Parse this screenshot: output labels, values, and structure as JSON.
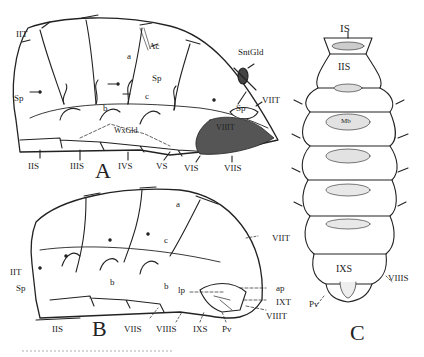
{
  "figure": {
    "panels": [
      {
        "id": "A",
        "letter": "A",
        "labels": {
          "IIT": "IIT",
          "Sp_left": "Sp",
          "a": "a",
          "Ac": "Ac",
          "Sp_mid": "Sp",
          "c": "c",
          "b": "b",
          "SntGld": "SntGld",
          "VIIT": "VIIT",
          "Sp_right": "Sp",
          "VIIIT": "VIIIT",
          "WxGld": "WxGld",
          "IIS": "IIS",
          "IIIS": "IIIS",
          "IVS": "IVS",
          "VS": "VS",
          "VIS": "VIS",
          "VIIS": "VIIS"
        }
      },
      {
        "id": "B",
        "letter": "B",
        "labels": {
          "IIT": "IIT",
          "Sp": "Sp",
          "a": "a",
          "c": "c",
          "b_left": "b",
          "b_right": "b",
          "VIIT": "VIIT",
          "lp": "lp",
          "ap": "ap",
          "IXT": "IXT",
          "VIIIT": "VIIIT",
          "IIS": "IIS",
          "VIIS": "VIIS",
          "VIIIS": "VIIIS",
          "IXS": "IXS",
          "Pv": "Pv"
        }
      },
      {
        "id": "C",
        "letter": "C",
        "labels": {
          "IS": "IS",
          "IIS": "IIS",
          "Mb": "Mb",
          "IXS": "IXS",
          "VIIIS": "VIIIS",
          "Pv": "Pv"
        }
      }
    ]
  }
}
